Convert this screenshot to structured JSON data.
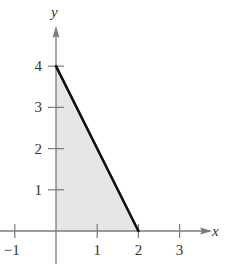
{
  "chart_data": {
    "type": "area",
    "title": "",
    "xlabel": "x",
    "ylabel": "y",
    "xlim": [
      -1.35,
      3.9
    ],
    "ylim": [
      -0.4,
      5.1
    ],
    "grid": false,
    "legend": null,
    "x_ticks": [
      -1,
      1,
      2,
      3
    ],
    "y_ticks": [
      1,
      2,
      3,
      4
    ],
    "x_tick_labels": [
      "−1",
      "1",
      "2",
      "3"
    ],
    "y_tick_labels": [
      "1",
      "2",
      "3",
      "4"
    ],
    "series": [
      {
        "name": "boundary line",
        "type": "line",
        "x": [
          0,
          2
        ],
        "y": [
          4,
          0
        ],
        "color": "#111111"
      }
    ],
    "shaded_region": {
      "description": "Triangle bounded by x=0, y=0 and the line y = 4 - 2x",
      "vertices": [
        [
          0,
          0
        ],
        [
          0,
          4
        ],
        [
          2,
          0
        ]
      ],
      "fill": "#e6e6e6"
    }
  },
  "colors": {
    "axis": "#7a7a7a",
    "line": "#111111",
    "fill": "#e6e6e6",
    "text": "#333333"
  }
}
